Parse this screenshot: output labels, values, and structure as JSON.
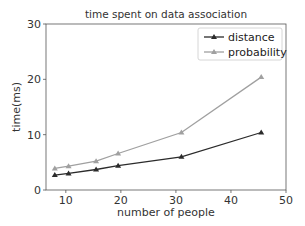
{
  "chart_data": {
    "type": "line",
    "title": "time spent on data association",
    "xlabel": "number of people",
    "ylabel": "time(ms)",
    "xlim": [
      6.4,
      50
    ],
    "ylim": [
      0,
      30
    ],
    "xticks": [
      10,
      20,
      30,
      40,
      50
    ],
    "yticks": [
      0,
      10,
      20,
      30
    ],
    "grid": false,
    "legend_position": "upper right",
    "x": [
      8,
      10.5,
      15.5,
      19.5,
      31,
      45.5
    ],
    "series": [
      {
        "name": "distance",
        "color": "#2b2b2b",
        "marker": "triangle",
        "values": [
          2.7,
          3.0,
          3.7,
          4.4,
          6.0,
          10.4
        ]
      },
      {
        "name": "probability",
        "color": "#a0a0a0",
        "marker": "triangle",
        "values": [
          3.9,
          4.3,
          5.2,
          6.6,
          10.4,
          20.4
        ]
      }
    ]
  }
}
